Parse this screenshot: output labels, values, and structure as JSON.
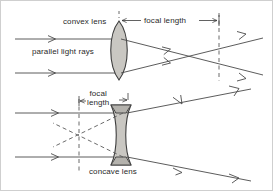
{
  "figure": {
    "title_visible": false,
    "colors": {
      "ray": "#4a4a4a",
      "lens_fill": "#c9c7c2",
      "lens_stroke": "#3d3d3d",
      "dashed": "#5a5a5a",
      "text": "#2a2a2a",
      "border": "#cfcfcf",
      "background": "#ffffff"
    },
    "labels": {
      "convex_lens": "convex lens",
      "focal_length_top": "focal length",
      "parallel_light_rays": "parallel light rays",
      "focal_length_bottom_line1": "focal",
      "focal_length_bottom_line2": "length",
      "concave_lens": "concave lens"
    },
    "diagrams": [
      {
        "name": "convex-lens-diagram",
        "lens_type": "biconvex",
        "ray_behavior": "converging",
        "focal_point": "right of lens, rays cross then diverge",
        "incoming_rays": 2,
        "outgoing_rays": 2
      },
      {
        "name": "concave-lens-diagram",
        "lens_type": "biconcave",
        "ray_behavior": "diverging",
        "focal_point": "virtual, left of lens on dashed line",
        "incoming_rays": 2,
        "outgoing_rays": 2,
        "virtual_ray_style": "dashed"
      }
    ]
  }
}
